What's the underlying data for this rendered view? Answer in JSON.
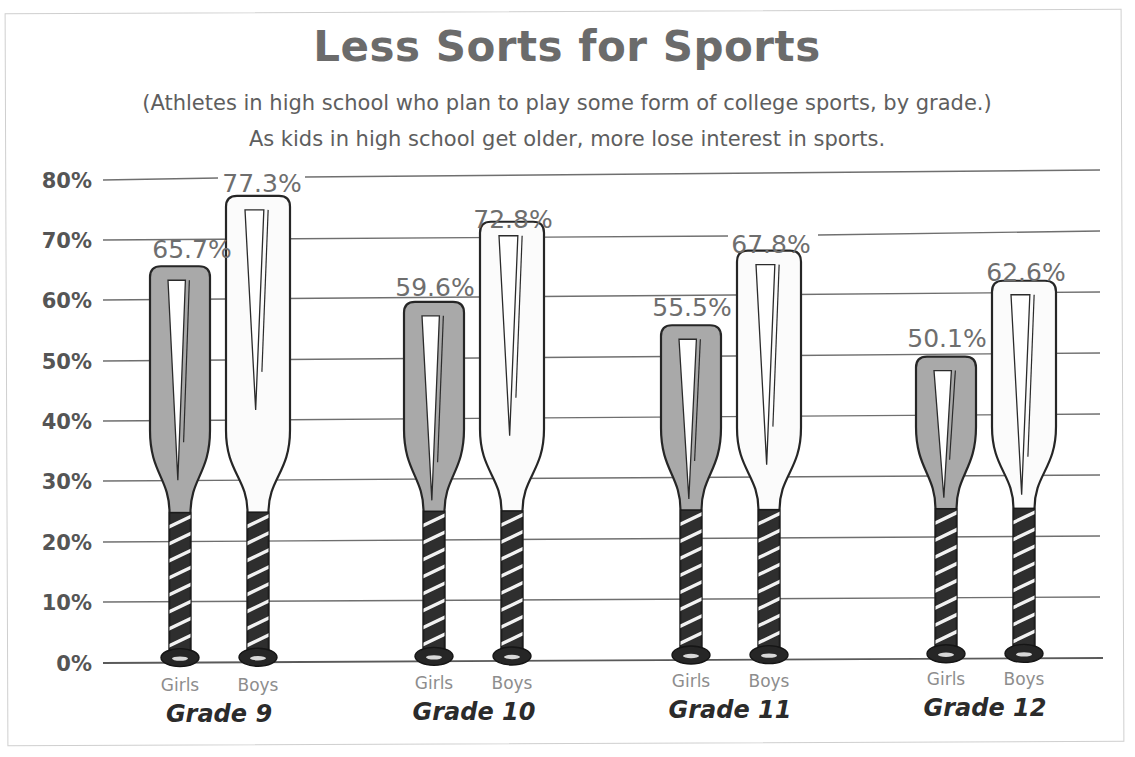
{
  "chart_data": {
    "type": "bar",
    "title": "Less Sorts for Sports",
    "subtitle_1": "(Athletes in high school who plan to play some form of college sports, by grade.)",
    "subtitle_2": "As kids in high school get older, more lose interest in sports.",
    "xlabel": "",
    "ylabel": "",
    "ylim": [
      0,
      80
    ],
    "grid": true,
    "legend_position": "none",
    "y_ticks": [
      "0%",
      "10%",
      "20%",
      "30%",
      "40%",
      "50%",
      "60%",
      "70%",
      "80%"
    ],
    "y_tick_values": [
      0,
      10,
      20,
      30,
      40,
      50,
      60,
      70,
      80
    ],
    "categories": [
      "Grade 9",
      "Grade 10",
      "Grade 11",
      "Grade 12"
    ],
    "series": [
      {
        "name": "Girls",
        "values": [
          65.7,
          59.6,
          55.5,
          50.1
        ],
        "color": "#a9a9a9"
      },
      {
        "name": "Boys",
        "values": [
          77.3,
          72.8,
          67.8,
          62.6
        ],
        "color": "#fbfbfb"
      }
    ],
    "data_labels": [
      {
        "group": "Grade 9",
        "series": "Girls",
        "label": "65.7%",
        "value": 65.7
      },
      {
        "group": "Grade 9",
        "series": "Boys",
        "label": "77.3%",
        "value": 77.3
      },
      {
        "group": "Grade 10",
        "series": "Girls",
        "label": "59.6%",
        "value": 59.6
      },
      {
        "group": "Grade 10",
        "series": "Boys",
        "label": "72.8%",
        "value": 72.8
      },
      {
        "group": "Grade 11",
        "series": "Girls",
        "label": "55.5%",
        "value": 55.5
      },
      {
        "group": "Grade 11",
        "series": "Boys",
        "label": "67.8%",
        "value": 67.8
      },
      {
        "group": "Grade 12",
        "series": "Girls",
        "label": "50.1%",
        "value": 50.1
      },
      {
        "group": "Grade 12",
        "series": "Boys",
        "label": "62.6%",
        "value": 62.6
      }
    ],
    "bar_glyph": "baseball-bat"
  },
  "colors": {
    "title": "#6b6b6b",
    "subtitle": "#5e5e5e",
    "value_label": "#6e6e6e",
    "category_label": "#2b2b2b",
    "series_sublabel": "#8d8d8d",
    "gridline": "#6f6f6f",
    "frame": "#cfcfcf",
    "girls_fill": "#a9a9a9",
    "boys_fill": "#fbfbfb",
    "grip": "#2e2e2e",
    "background": "#ffffff"
  }
}
